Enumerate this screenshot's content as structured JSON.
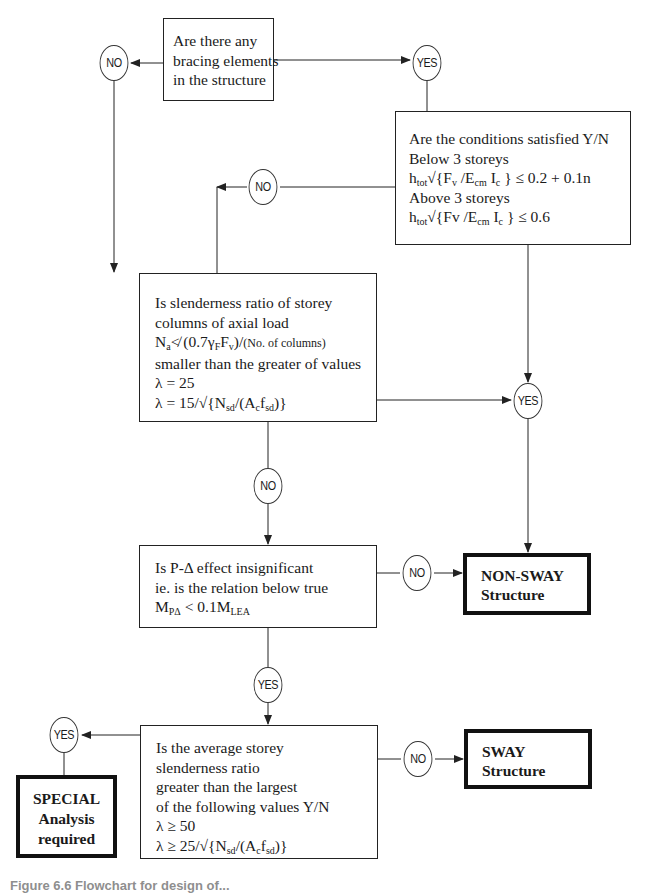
{
  "figure": {
    "caption": "Figure 6.6 Flowchart for design of..."
  },
  "nodes": {
    "bracing": {
      "lines": [
        "Are there any",
        "bracing elements",
        "in the structure"
      ]
    },
    "conditions": {
      "lines": [
        "Are the conditions satisfied Y/N",
        "Below 3 storeys",
        "Above 3 storeys"
      ],
      "formula1": {
        "h": "h",
        "h_sub": "tot",
        "rest1": "√{F",
        "v_sub": "v",
        "rest2": " /E",
        "e_sub": "cm",
        "rest3": " I",
        "i_sub": "c",
        "rest4": " } ≤ 0.2 + 0.1n"
      },
      "formula2": {
        "h": "h",
        "h_sub": "tot",
        "rest1": "√{Fv /E",
        "e_sub": "cm",
        "rest3": " I",
        "i_sub": "c",
        "rest4": " } ≤ 0.6"
      }
    },
    "slenderness": {
      "lines": [
        "Is slenderness ratio of storey",
        "columns of axial load",
        "smaller than the greater of values",
        "λ = 25"
      ],
      "axial": {
        "n": "N",
        "n_sub": "a",
        "rest": "≮ (0.7γ",
        "g_sub": "F",
        "f": "F",
        "f_sub": "v",
        "close": ")/",
        "note": "(No. of columns)"
      },
      "lambda2": {
        "pre": "λ = 15/√{N",
        "n_sub": "sd",
        "mid": "/(A",
        "a_sub": "c",
        "f": "f",
        "f_sub": "sd",
        "post": ")}"
      }
    },
    "p_delta": {
      "lines": [
        "Is P-Δ effect insignificant",
        "ie. is the relation below true"
      ],
      "relation": {
        "m": "M",
        "m_sub": "PΔ",
        "mid": " < 0.1M",
        "m2_sub": "LEA"
      }
    },
    "average": {
      "lines": [
        "Is the average storey",
        "slenderness ratio",
        "greater than the largest",
        "of the following values Y/N",
        "λ ≥ 50"
      ],
      "lambda2": {
        "pre": "λ ≥ 25/√{N",
        "n_sub": "sd",
        "mid": "/(A",
        "a_sub": "c",
        "f": "f",
        "f_sub": "sd",
        "post": ")}"
      }
    },
    "non_sway": {
      "lines": [
        "NON-SWAY",
        "Structure"
      ]
    },
    "sway": {
      "lines": [
        "SWAY",
        "Structure"
      ]
    },
    "special": {
      "lines": [
        "SPECIAL",
        "Analysis",
        "required"
      ]
    }
  },
  "decisions": {
    "bracing_no": "NO",
    "bracing_yes": "YES",
    "conditions_no": "NO",
    "slender_yes": "YES",
    "slender_no": "NO",
    "pdelta_no": "NO",
    "pdelta_yes": "YES",
    "average_yes": "YES",
    "average_no": "NO"
  },
  "colors": {
    "line": "#222222",
    "background": "#ffffff"
  }
}
